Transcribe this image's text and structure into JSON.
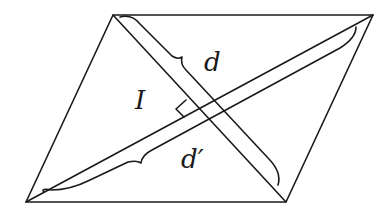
{
  "diagram": {
    "type": "parallelogram-with-diagonals",
    "stroke_color": "#1a1a1a",
    "background": "#ffffff",
    "vertices": {
      "top_left": [
        113,
        15
      ],
      "top_right": [
        373,
        15
      ],
      "bottom_right": [
        286,
        202
      ],
      "bottom_left": [
        26,
        202
      ]
    },
    "labels": {
      "diagonal_1": "d",
      "diagonal_2": "d′",
      "perpendicular": "I"
    },
    "annotations": {
      "right_angle_marker": true,
      "brace_diagonal_1": "d",
      "brace_diagonal_2": "d′"
    }
  }
}
